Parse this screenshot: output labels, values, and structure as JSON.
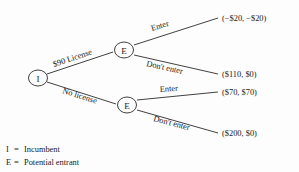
{
  "diagram": {
    "nodes": [
      {
        "id": "root",
        "label": "I",
        "role": "incumbent"
      },
      {
        "id": "upper",
        "label": "E",
        "role": "potential-entrant"
      },
      {
        "id": "lower",
        "label": "E",
        "role": "potential-entrant"
      }
    ],
    "edges": [
      {
        "id": "license",
        "label": "$90 License",
        "from": "root",
        "to": "upper"
      },
      {
        "id": "no-license",
        "label": "No license",
        "from": "root",
        "to": "lower"
      },
      {
        "id": "upper-enter",
        "label": "Enter",
        "from": "upper",
        "to": "payoff-1"
      },
      {
        "id": "upper-dont-enter",
        "label": "Don't enter",
        "from": "upper",
        "to": "payoff-2"
      },
      {
        "id": "lower-enter",
        "label": "Enter",
        "from": "lower",
        "to": "payoff-3"
      },
      {
        "id": "lower-dont-enter",
        "label": "Don't enter",
        "from": "lower",
        "to": "payoff-4"
      }
    ],
    "payoffs": [
      {
        "id": "payoff-1",
        "text": "(−$20, −$20)",
        "incumbent": "-$20",
        "entrant": "-$20"
      },
      {
        "id": "payoff-2",
        "text": "($110, $0)",
        "incumbent": "$110",
        "entrant": "$0"
      },
      {
        "id": "payoff-3",
        "text": "($70, $70)",
        "incumbent": "$70",
        "entrant": "$70"
      },
      {
        "id": "payoff-4",
        "text": "($200, $0)",
        "incumbent": "$200",
        "entrant": "$0"
      }
    ]
  },
  "legend": {
    "entries": [
      {
        "key": "I",
        "eq": "=",
        "text": "Incumbent"
      },
      {
        "key": "E",
        "eq": "=",
        "text": "Potential entrant"
      }
    ]
  },
  "colors": {
    "background": "#fdfdfd",
    "ink": "#1a1a1a",
    "stroke": "#2b2b2b"
  }
}
